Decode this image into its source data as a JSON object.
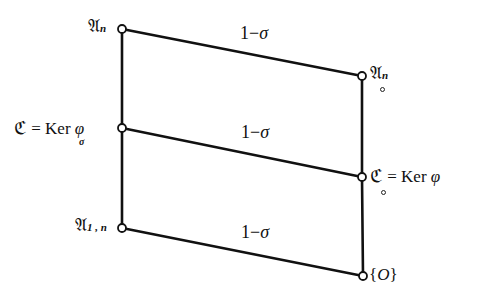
{
  "diagram": {
    "type": "lattice",
    "line_color": "#111111",
    "node_fill": "#ffffff",
    "nodes": {
      "left_top": {
        "x": 122,
        "y": 29,
        "symbol": "𝔄",
        "sub": "n",
        "label": "𝔄_n"
      },
      "left_mid": {
        "x": 122,
        "y": 128,
        "label_lhs": "ℭ",
        "equals": "=",
        "ker": "Ker",
        "ker_sub": "σ",
        "phi": "φ",
        "label": "ℭ = Ker_σ φ"
      },
      "left_bot": {
        "x": 122,
        "y": 228,
        "symbol": "𝔄",
        "sub": "1 , n",
        "label": "𝔄_{1,n}"
      },
      "right_top": {
        "x": 362,
        "y": 76,
        "symbol": "𝔄",
        "sub": "n",
        "under": "∘",
        "label": "𝔄̥_n"
      },
      "right_mid": {
        "x": 362,
        "y": 177,
        "label_lhs": "ℭ",
        "under": "∘",
        "equals": "=",
        "ker": "Ker",
        "phi": "φ",
        "label": "ℭ̥ = Ker φ"
      },
      "right_bot": {
        "x": 363,
        "y": 276,
        "open": "{",
        "symbol": "O",
        "close": "}",
        "label": "{O}"
      }
    },
    "edges": [
      {
        "from": "left_top",
        "to": "left_mid",
        "label": ""
      },
      {
        "from": "left_mid",
        "to": "left_bot",
        "label": ""
      },
      {
        "from": "right_top",
        "to": "right_mid",
        "label": ""
      },
      {
        "from": "right_mid",
        "to": "right_bot",
        "label": ""
      },
      {
        "from": "left_top",
        "to": "right_top",
        "label": "1−σ"
      },
      {
        "from": "left_mid",
        "to": "right_mid",
        "label": "1−σ"
      },
      {
        "from": "left_bot",
        "to": "right_bot",
        "label": "1−σ"
      }
    ],
    "edge_labels": {
      "top": {
        "one": "1",
        "minus": "−",
        "sigma": "σ"
      },
      "middle": {
        "one": "1",
        "minus": "−",
        "sigma": "σ"
      },
      "bottom": {
        "one": "1",
        "minus": "−",
        "sigma": "σ"
      }
    }
  }
}
